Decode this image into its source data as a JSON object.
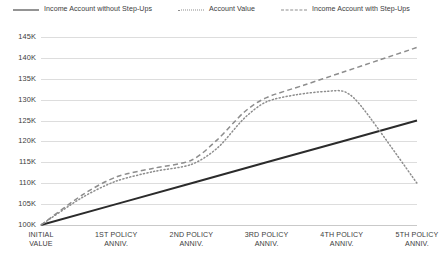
{
  "chart_data": {
    "type": "line",
    "title": "",
    "subtitle": "",
    "xlabel": "",
    "ylabel": "",
    "ylim": [
      100000,
      145000
    ],
    "ytick_step": 5000,
    "grid": true,
    "legend_position": "top-center",
    "categories": [
      "INITIAL VALUE",
      "1ST POLICY ANNIV.",
      "2ND POLICY ANNIV.",
      "3RD POLICY ANNIV.",
      "4TH POLICY ANNIV.",
      "5TH POLICY ANNIV."
    ],
    "x": [
      0,
      1,
      2,
      3,
      4,
      5
    ],
    "ytick_labels": [
      "100K",
      "105K",
      "110K",
      "115K",
      "120K",
      "125K",
      "130K",
      "135K",
      "140K",
      "145K"
    ],
    "ytick_values": [
      100000,
      105000,
      110000,
      115000,
      120000,
      125000,
      130000,
      135000,
      140000,
      145000
    ],
    "series": [
      {
        "name": "Income Account without Step-Ups",
        "style": "solid",
        "color": "#2b2b2b",
        "values": [
          100000,
          105000,
          110000,
          115000,
          120000,
          125000
        ]
      },
      {
        "name": "Account Value",
        "style": "dotted",
        "color": "#8d8d8d",
        "values": [
          100000,
          110500,
          114500,
          129500,
          132000,
          110000
        ],
        "control_points": [
          {
            "x": 0.0,
            "y": 100000
          },
          {
            "x": 0.55,
            "y": 106600
          },
          {
            "x": 1.0,
            "y": 110500
          },
          {
            "x": 1.5,
            "y": 112800
          },
          {
            "x": 2.0,
            "y": 114500
          },
          {
            "x": 2.35,
            "y": 118500
          },
          {
            "x": 2.7,
            "y": 125500
          },
          {
            "x": 3.0,
            "y": 129500
          },
          {
            "x": 3.4,
            "y": 131200
          },
          {
            "x": 3.8,
            "y": 132000
          },
          {
            "x": 4.05,
            "y": 131800
          },
          {
            "x": 4.3,
            "y": 127500
          },
          {
            "x": 5.0,
            "y": 110000
          }
        ]
      },
      {
        "name": "Income Account with Step-Ups",
        "style": "dashed",
        "color": "#8d8d8d",
        "values": [
          100000,
          111500,
          115500,
          130500,
          136500,
          142500
        ],
        "control_points": [
          {
            "x": 0.0,
            "y": 100000
          },
          {
            "x": 0.55,
            "y": 107200
          },
          {
            "x": 1.0,
            "y": 111500
          },
          {
            "x": 1.5,
            "y": 113600
          },
          {
            "x": 2.0,
            "y": 115500
          },
          {
            "x": 2.35,
            "y": 120500
          },
          {
            "x": 2.7,
            "y": 127000
          },
          {
            "x": 3.0,
            "y": 130500
          },
          {
            "x": 3.5,
            "y": 133500
          },
          {
            "x": 4.0,
            "y": 136500
          },
          {
            "x": 4.5,
            "y": 139500
          },
          {
            "x": 5.0,
            "y": 142500
          }
        ]
      }
    ]
  },
  "legend": {
    "items": [
      {
        "label": "Income Account without Step-Ups",
        "style": "solid"
      },
      {
        "label": "Account Value",
        "style": "dotted"
      },
      {
        "label": "Income Account with Step-Ups",
        "style": "dashed"
      }
    ]
  },
  "axis": {
    "y_labels": [
      "145K",
      "140K",
      "135K",
      "130K",
      "125K",
      "120K",
      "115K",
      "110K",
      "105K",
      "100K"
    ],
    "x_labels": [
      {
        "line1": "INITIAL",
        "line2": "VALUE"
      },
      {
        "line1": "1ST POLICY",
        "line2": "ANNIV."
      },
      {
        "line1": "2ND POLICY",
        "line2": "ANNIV."
      },
      {
        "line1": "3RD POLICY",
        "line2": "ANNIV."
      },
      {
        "line1": "4TH POLICY",
        "line2": "ANNIV."
      },
      {
        "line1": "5TH POLICY",
        "line2": "ANNIV."
      }
    ]
  },
  "colors": {
    "solid_series": "#2b2b2b",
    "dashed_series": "#8d8d8d",
    "dotted_series": "#8d8d8d",
    "gridline": "#dddddd",
    "text": "#3c3c3c",
    "background": "#ffffff"
  }
}
